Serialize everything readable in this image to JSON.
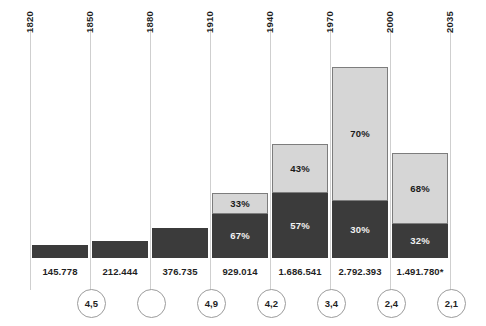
{
  "chart_data": {
    "type": "bar",
    "title": "",
    "subtitle": "",
    "xlabel": "",
    "ylabel": "",
    "stacked": true,
    "grid": true,
    "legend_position": "none",
    "axis_tick_labels": [
      "1820",
      "1850",
      "1880",
      "1910",
      "1940",
      "1970",
      "2000",
      "2035"
    ],
    "categories": [
      "1820",
      "1850",
      "1880",
      "1910",
      "1940",
      "1970",
      "2000",
      "2035"
    ],
    "value_labels": [
      "145.778",
      "212.444",
      "376.735",
      "929.014",
      "1.686.541",
      "2.792.393",
      "1.491.780*"
    ],
    "circle_labels": [
      "4,5",
      "",
      "4,9",
      "4,2",
      "3,4",
      "2,4",
      "2,1"
    ],
    "colors": {
      "dark_segment": "#3b3b3b",
      "light_segment": "#d6d6d6",
      "segment_border": "#7d7d7d",
      "gridline": "#cfcfcf",
      "text": "#1f1f1f",
      "light_text": "#f2f2f2",
      "background": "#ffffff"
    },
    "bars": [
      {
        "period": "1820-1850",
        "value_label": "145.778",
        "value": 145778,
        "circle_label": "4,5",
        "dark_pct": null,
        "light_pct": null,
        "dark_pct_label": "",
        "light_pct_label": "",
        "total_height_px": 13
      },
      {
        "period": "1850-1880",
        "value_label": "212.444",
        "value": 212444,
        "circle_label": "",
        "dark_pct": null,
        "light_pct": null,
        "dark_pct_label": "",
        "light_pct_label": "",
        "total_height_px": 17
      },
      {
        "period": "1880-1910",
        "value_label": "376.735",
        "value": 376735,
        "circle_label": "4,9",
        "dark_pct": null,
        "light_pct": null,
        "dark_pct_label": "",
        "light_pct_label": "",
        "total_height_px": 30
      },
      {
        "period": "1910-1940",
        "value_label": "929.014",
        "value": 929014,
        "circle_label": "4,2",
        "dark_pct": 67,
        "light_pct": 33,
        "dark_pct_label": "67%",
        "light_pct_label": "33%",
        "total_height_px": 65
      },
      {
        "period": "1940-1970",
        "value_label": "1.686.541",
        "value": 1686541,
        "circle_label": "3,4",
        "dark_pct": 57,
        "light_pct": 43,
        "dark_pct_label": "57%",
        "light_pct_label": "43%",
        "total_height_px": 114
      },
      {
        "period": "1970-2000",
        "value_label": "2.792.393",
        "value": 2792393,
        "circle_label": "2,4",
        "dark_pct": 30,
        "light_pct": 70,
        "dark_pct_label": "30%",
        "light_pct_label": "70%",
        "total_height_px": 191
      },
      {
        "period": "2000-2035",
        "value_label": "1.491.780*",
        "value": 1491780,
        "circle_label": "2,1",
        "dark_pct": 32,
        "light_pct": 68,
        "dark_pct_label": "32%",
        "light_pct_label": "68%",
        "total_height_px": 105
      }
    ]
  }
}
